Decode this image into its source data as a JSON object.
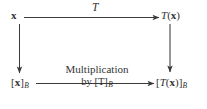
{
  "diagram": {
    "kind": "commutative-diagram",
    "background_color": "#ffffff",
    "ink_color": "#333333",
    "nodes": {
      "top_left": {
        "text": "x",
        "parts": [
          {
            "text": "x",
            "style": "bold"
          }
        ]
      },
      "top_right": {
        "text": "T(x)",
        "parts": [
          {
            "text": "T",
            "style": "italic"
          },
          {
            "text": "(",
            "style": "roman"
          },
          {
            "text": "x",
            "style": "bold"
          },
          {
            "text": ")",
            "style": "roman"
          }
        ]
      },
      "bottom_left": {
        "text": "[x]B",
        "parts": [
          {
            "text": "[",
            "style": "roman"
          },
          {
            "text": "x",
            "style": "bold"
          },
          {
            "text": "]",
            "style": "roman"
          },
          {
            "text": "B",
            "style": "subscript-script"
          }
        ]
      },
      "bottom_right": {
        "text": "[T(x)]B",
        "parts": [
          {
            "text": "[",
            "style": "roman"
          },
          {
            "text": "T",
            "style": "italic"
          },
          {
            "text": "(",
            "style": "roman"
          },
          {
            "text": "x",
            "style": "bold"
          },
          {
            "text": ")]",
            "style": "roman"
          },
          {
            "text": "B",
            "style": "subscript-script"
          }
        ]
      }
    },
    "edges": {
      "top": {
        "from": "top_left",
        "to": "top_right",
        "direction": "right",
        "label": "T",
        "label_style": "italic"
      },
      "left": {
        "from": "top_left",
        "to": "bottom_left",
        "direction": "down",
        "label": ""
      },
      "right": {
        "from": "top_right",
        "to": "bottom_right",
        "direction": "down",
        "label": ""
      },
      "bottom": {
        "from": "bottom_left",
        "to": "bottom_right",
        "direction": "right",
        "label_line_1": "Multiplication",
        "label_line_2_prefix": "by [",
        "label_line_2_T": "T",
        "label_line_2_suffix": "]",
        "label_line_2_subscript": "B"
      }
    }
  }
}
